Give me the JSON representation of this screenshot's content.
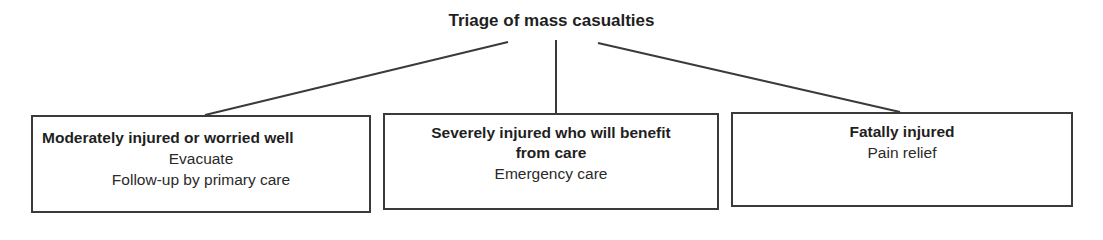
{
  "diagram": {
    "title": "Triage of mass casualties",
    "categories": [
      {
        "heading": "Moderately injured or worried well",
        "actions": [
          "Evacuate",
          "Follow-up by primary care"
        ]
      },
      {
        "heading": "Severely injured who will benefit from care",
        "actions": [
          "Emergency care"
        ]
      },
      {
        "heading": "Fatally injured",
        "actions": [
          "Pain relief"
        ]
      }
    ],
    "colors": {
      "line": "#3a3a3a",
      "text": "#1f1f1f",
      "background": "#ffffff"
    }
  }
}
